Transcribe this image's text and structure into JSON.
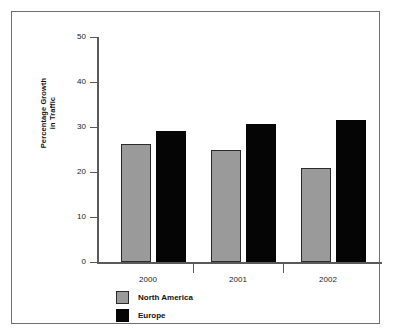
{
  "chart_data": {
    "type": "bar",
    "title": "",
    "subtitle": "",
    "xlabel": "",
    "ylabel": "Percentage Growth\nin Traffic",
    "ylabel_line1": "Percentage Growth",
    "ylabel_line2": "in Traffic",
    "categories": [
      "2000",
      "2001",
      "2002"
    ],
    "series": [
      {
        "name": "North America",
        "color": "#9a9a9a",
        "values": [
          26.2,
          24.9,
          20.8
        ]
      },
      {
        "name": "Europe",
        "color": "#050505",
        "values": [
          29.1,
          30.7,
          31.5
        ]
      }
    ],
    "ylim": [
      0,
      50
    ],
    "yticks": [
      0,
      10,
      20,
      30,
      40,
      50
    ],
    "ytick_labels": [
      "0",
      "10",
      "20",
      "30",
      "40",
      "50"
    ],
    "grid": false,
    "legend_position": "bottom-left",
    "legend": [
      {
        "label": "North America",
        "color": "#9a9a9a"
      },
      {
        "label": "Europe",
        "color": "#050505"
      }
    ]
  },
  "axes": {
    "y_ticks": [
      {
        "label": "50",
        "value": 50
      },
      {
        "label": "40",
        "value": 40
      },
      {
        "label": "30",
        "value": 30
      },
      {
        "label": "20",
        "value": 20
      },
      {
        "label": "10",
        "value": 10
      },
      {
        "label": "0",
        "value": 0
      }
    ],
    "x_ticks": [
      {
        "label": "2000"
      },
      {
        "label": "2001"
      },
      {
        "label": "2002"
      }
    ]
  },
  "colors": {
    "frame": "#6e6e6e",
    "axis": "#5a5a5a",
    "background": "#ffffff",
    "north_america": "#9a9a9a",
    "europe": "#050505",
    "text": "#111111"
  }
}
